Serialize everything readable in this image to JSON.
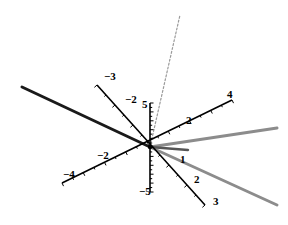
{
  "chart_data": {
    "type": "vector-3d",
    "title": "",
    "origin_px": [
      150,
      147
    ],
    "colors": {
      "axis": "#000000",
      "vector_dark": "#1a1a1a",
      "vector_gray": "#8c8c8c",
      "vector_mid": "#555555",
      "vector_dashed": "#9a9a9a"
    },
    "axes": [
      {
        "name": "axis-x",
        "from_px": [
          97,
          85
        ],
        "to_px": [
          205,
          205
        ],
        "tick_labels": [
          {
            "text": "-3",
            "px": [
              104,
              80
            ]
          },
          {
            "text": "-2",
            "px": [
              125,
              103
            ]
          },
          {
            "text": "1",
            "px": [
              180,
              163
            ]
          },
          {
            "text": "2",
            "px": [
              194,
              183
            ]
          },
          {
            "text": "3",
            "px": [
              213,
              205
            ]
          }
        ],
        "range": [
          -3,
          3
        ]
      },
      {
        "name": "axis-y",
        "from_px": [
          62,
          183
        ],
        "to_px": [
          232,
          100
        ],
        "tick_labels": [
          {
            "text": "-4",
            "px": [
              63,
              178
            ]
          },
          {
            "text": "-2",
            "px": [
              97,
              159
            ]
          },
          {
            "text": "2",
            "px": [
              186,
              124
            ]
          },
          {
            "text": "4",
            "px": [
              227,
              98
            ]
          }
        ],
        "range": [
          -4,
          4
        ]
      },
      {
        "name": "axis-z",
        "from_px": [
          150,
          103
        ],
        "to_px": [
          150,
          192
        ],
        "tick_labels": [
          {
            "text": "5",
            "px": [
              142,
              108
            ]
          },
          {
            "text": "-5",
            "px": [
              139,
              195
            ]
          }
        ],
        "range": [
          -5,
          5
        ]
      }
    ],
    "vectors": [
      {
        "name": "vector-dark-long",
        "from_px": [
          150,
          147
        ],
        "to_px": [
          22,
          87
        ],
        "style": "solid",
        "color": "#1a1a1a",
        "width": 3
      },
      {
        "name": "vector-dashed",
        "from_px": [
          150,
          147
        ],
        "to_px": [
          180,
          15
        ],
        "style": "dashed",
        "color": "#9a9a9a",
        "width": 1.2
      },
      {
        "name": "vector-gray-upper",
        "from_px": [
          150,
          147
        ],
        "to_px": [
          277,
          128
        ],
        "style": "solid",
        "color": "#8c8c8c",
        "width": 3
      },
      {
        "name": "vector-gray-lower",
        "from_px": [
          150,
          147
        ],
        "to_px": [
          277,
          205
        ],
        "style": "solid",
        "color": "#8c8c8c",
        "width": 3
      },
      {
        "name": "vector-short",
        "from_px": [
          150,
          147
        ],
        "to_px": [
          188,
          150
        ],
        "style": "solid",
        "color": "#555555",
        "width": 2.5
      }
    ]
  }
}
